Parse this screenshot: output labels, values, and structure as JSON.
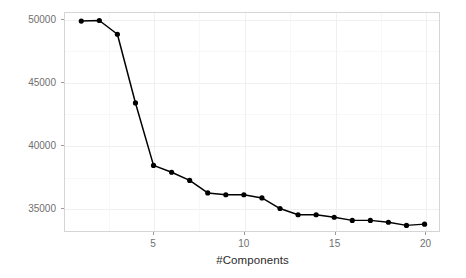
{
  "chart_data": {
    "type": "line",
    "title": "",
    "xlabel": "#Components",
    "ylabel": "RMSE (Cross-Validation)",
    "x": [
      1,
      2,
      3,
      4,
      5,
      6,
      7,
      8,
      9,
      10,
      11,
      12,
      13,
      14,
      15,
      16,
      17,
      18,
      19,
      20
    ],
    "values": [
      49900,
      49950,
      48850,
      43350,
      38350,
      37800,
      37150,
      36150,
      36000,
      36000,
      35750,
      34900,
      34400,
      34400,
      34200,
      33950,
      33950,
      33800,
      33550,
      33650
    ],
    "series": [
      {
        "name": "RMSE (Cross-Validation)",
        "values": [
          49900,
          49950,
          48850,
          43350,
          38350,
          37800,
          37150,
          36150,
          36000,
          36000,
          35750,
          34900,
          34400,
          34400,
          34200,
          33950,
          33950,
          33800,
          33550,
          33650
        ]
      }
    ],
    "xlim": [
      0.1,
      20.8
    ],
    "ylim": [
      33100,
      50550
    ],
    "xticks": [
      5,
      10,
      15,
      20
    ],
    "xtick_labels": [
      "5",
      "10",
      "15",
      "20"
    ],
    "yticks": [
      35000,
      40000,
      45000,
      50000
    ],
    "ytick_labels": [
      "35000",
      "40000",
      "45000",
      "50000"
    ],
    "grid": true,
    "legend": "none",
    "marker": "filled-circle",
    "line_color": "#000000",
    "marker_color": "#000000",
    "panel_background": "#ffffff",
    "grid_color": "#f0f0f0",
    "panel_border_color": "#d5d5d5"
  }
}
